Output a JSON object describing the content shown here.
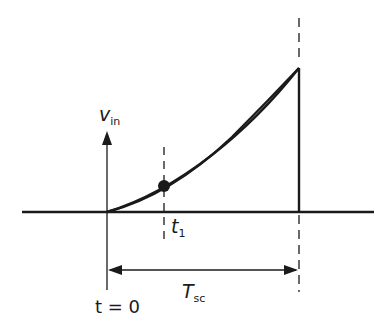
{
  "diagram": {
    "title": "",
    "y_axis_label": {
      "main": "v",
      "sub": "in"
    },
    "marker_label": {
      "main": "t",
      "sub": "1"
    },
    "origin_label": "t = 0",
    "duration_label": {
      "main": "T",
      "sub": "sc"
    },
    "colors": {
      "line": "#1a1a1a",
      "background": "#ffffff"
    }
  }
}
